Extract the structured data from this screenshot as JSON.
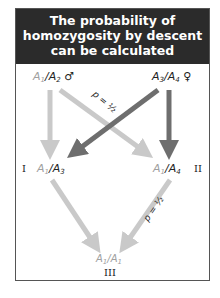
{
  "title_lines": [
    "The probability of",
    "homozygosity by descent",
    "can be calculated"
  ],
  "colors": {
    "header_bg": "#2b2b2b",
    "light_arrow": "#c9c9c9",
    "dark_arrow": "#6e6e6e",
    "light_text": "#a0a0a0",
    "dark_text": "#222222"
  },
  "parents": {
    "male": {
      "allele1": "A",
      "allele1_sub": "1",
      "allele2": "A",
      "allele2_sub": "2",
      "symbol": "♂"
    },
    "female": {
      "allele1": "A",
      "allele1_sub": "3",
      "allele2": "A",
      "allele2_sub": "4",
      "symbol": "♀"
    }
  },
  "offspring": {
    "I": {
      "label": "I",
      "allele1": "A",
      "allele1_sub": "1",
      "allele2": "A",
      "allele2_sub": "3"
    },
    "II": {
      "label": "II",
      "allele1": "A",
      "allele1_sub": "1",
      "allele2": "A",
      "allele2_sub": "4"
    },
    "III": {
      "label": "III",
      "allele1": "A",
      "allele1_sub": "1",
      "allele2": "A",
      "allele2_sub": "1"
    }
  },
  "probabilities": {
    "p1": "p = ½",
    "p2": "p = ½"
  }
}
